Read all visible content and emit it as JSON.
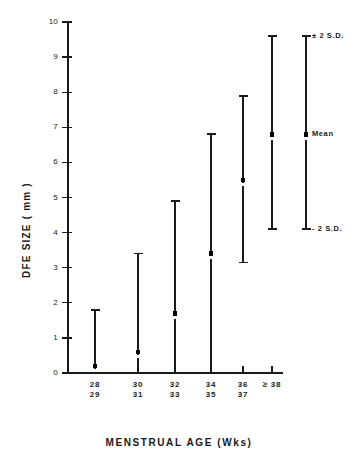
{
  "chart_data": {
    "type": "bar",
    "title": "",
    "xlabel": "MENSTRUAL AGE (Wks)",
    "ylabel": "DFE SIZE ( mm )",
    "categories": [
      "28\n29",
      "30\n31",
      "32\n33",
      "34\n35",
      "36\n37",
      "≥ 38"
    ],
    "category_lines": [
      [
        "28",
        "29"
      ],
      [
        "30",
        "31"
      ],
      [
        "32",
        "33"
      ],
      [
        "34",
        "35"
      ],
      [
        "36",
        "37"
      ],
      [
        "≥ 38",
        ""
      ]
    ],
    "ylim": [
      0,
      10
    ],
    "yticks": [
      0,
      1,
      2,
      3,
      4,
      5,
      6,
      7,
      8,
      9,
      10
    ],
    "ytick_labels": [
      "0",
      "1",
      "2",
      "3",
      "4",
      "5",
      "6",
      "7",
      "8",
      "9",
      "10"
    ],
    "grid": false,
    "legend_position": "upper-right",
    "series": [
      {
        "name": "Mean",
        "values": [
          0.2,
          0.6,
          1.7,
          3.4,
          5.5,
          6.8
        ]
      },
      {
        "name": "+2 S.D.",
        "values": [
          1.8,
          3.4,
          4.9,
          6.8,
          7.9,
          9.6
        ]
      },
      {
        "name": "-2 S.D.",
        "values": [
          0.0,
          0.0,
          0.0,
          0.0,
          3.15,
          4.1
        ]
      }
    ],
    "annotations": [
      {
        "id": "plus-2-sd",
        "text": "± 2 S.D.",
        "value": 9.6
      },
      {
        "id": "mean",
        "text": "Mean",
        "value": 6.8
      },
      {
        "id": "minus-2-sd",
        "text": "- 2 S.D.",
        "value": 4.1
      }
    ],
    "colors": {
      "ink": "#1a1a1a",
      "background": "#ffffff"
    }
  }
}
